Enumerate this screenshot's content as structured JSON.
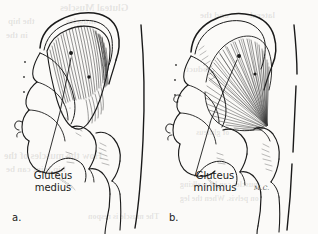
{
  "figure": {
    "type": "anatomical-line-drawing",
    "background_color": "#fbfaf8",
    "ink_color": "#1a1a1a",
    "page_width": 318,
    "page_height": 234
  },
  "panels": [
    {
      "letter": "a.",
      "muscle_label_line1": "Gluteus",
      "muscle_label_line2": "medius",
      "muscle_name": "Gluteus medius",
      "fiber_pattern": "parallel converging hatch from iliac crest to greater trochanter",
      "label_leader_dots": 2
    },
    {
      "letter": "b.",
      "muscle_label_line1": "Gluteus",
      "muscle_label_line2": "minimus",
      "muscle_name": "Gluteus minimus",
      "fiber_pattern": "radiating fan from gluteal surface of ilium to greater trochanter",
      "label_leader_dots": 2
    }
  ],
  "artist_signature": "M.C.",
  "bleed_through_text": [
    {
      "text": "Gluteal Muscles",
      "x": 60,
      "y": 2,
      "size": 10
    },
    {
      "text": "the hip",
      "x": 8,
      "y": 16,
      "size": 9
    },
    {
      "text": "muscles",
      "x": 66,
      "y": 16,
      "size": 9
    },
    {
      "text": "and the",
      "x": 200,
      "y": 10,
      "size": 9
    },
    {
      "text": "lateral",
      "x": 250,
      "y": 10,
      "size": 9
    },
    {
      "text": "in the",
      "x": 6,
      "y": 30,
      "size": 9
    },
    {
      "text": "abduct",
      "x": 186,
      "y": 64,
      "size": 9
    },
    {
      "text": "How the muscles of the",
      "x": 4,
      "y": 150,
      "size": 10
    },
    {
      "text": "hip joint can be",
      "x": 6,
      "y": 164,
      "size": 9
    },
    {
      "text": "The muscle is respon",
      "x": 88,
      "y": 212,
      "size": 8
    },
    {
      "text": "muscles can be walking",
      "x": 180,
      "y": 180,
      "size": 8
    },
    {
      "text": "on pelvis. When the leg",
      "x": 180,
      "y": 194,
      "size": 8
    },
    {
      "text": "of gluteus",
      "x": 196,
      "y": 128,
      "size": 8
    }
  ]
}
